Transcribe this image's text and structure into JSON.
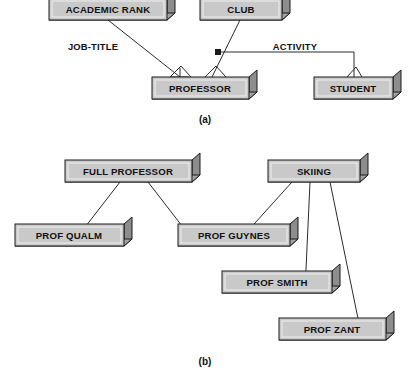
{
  "figure": {
    "background_color": "#ffffff",
    "box_fill_color": "#c9c9c9",
    "box_side_color": "#8d8d8d",
    "box_bottom_color": "#a2a2a2",
    "line_color": "#2b2b2b",
    "text_color": "#111111"
  },
  "panels": [
    {
      "id": "panel-a",
      "caption": "(a)",
      "caption_x": 205,
      "caption_y": 120,
      "nodes": [
        {
          "id": "academic-rank",
          "label": "ACADEMIC RANK",
          "x": 49,
          "y": -2,
          "w": 118,
          "h": 22
        },
        {
          "id": "club",
          "label": "CLUB",
          "x": 200,
          "y": -2,
          "w": 82,
          "h": 22
        },
        {
          "id": "professor",
          "label": "PROFESSOR",
          "x": 152,
          "y": 77,
          "w": 97,
          "h": 22
        },
        {
          "id": "student",
          "label": "STUDENT",
          "x": 314,
          "y": 77,
          "w": 79,
          "h": 22
        }
      ],
      "edges": [
        {
          "id": "job-title-edge",
          "label": "JOB-TITLE",
          "label_x": 93,
          "label_y": 48,
          "from": "academic-rank",
          "to": "professor",
          "marker": "crowfoot"
        },
        {
          "id": "club-professor-edge",
          "label": "",
          "from": "club",
          "to": "professor",
          "marker": "crowfoot"
        },
        {
          "id": "activity-edge",
          "label": "ACTIVITY",
          "label_x": 295,
          "label_y": 48,
          "from": "club",
          "to": "student",
          "marker": "crowfoot"
        }
      ],
      "junction": {
        "id": "activity-junction",
        "x": 218,
        "y": 52
      }
    },
    {
      "id": "panel-b",
      "caption": "(b)",
      "caption_x": 205,
      "caption_y": 362,
      "nodes": [
        {
          "id": "full-professor",
          "label": "FULL PROFESSOR",
          "x": 65,
          "y": 160,
          "w": 127,
          "h": 22
        },
        {
          "id": "skiing",
          "label": "SKIING",
          "x": 268,
          "y": 160,
          "w": 92,
          "h": 22
        },
        {
          "id": "prof-qualm",
          "label": "PROF QUALM",
          "x": 15,
          "y": 224,
          "w": 109,
          "h": 22
        },
        {
          "id": "prof-guynes",
          "label": "PROF GUYNES",
          "x": 178,
          "y": 224,
          "w": 112,
          "h": 22
        },
        {
          "id": "prof-smith",
          "label": "PROF SMITH",
          "x": 222,
          "y": 271,
          "w": 110,
          "h": 22
        },
        {
          "id": "prof-zant",
          "label": "PROF ZANT",
          "x": 279,
          "y": 318,
          "w": 107,
          "h": 22
        }
      ],
      "edges": [
        {
          "id": "fp-qualm-edge",
          "from": "full-professor",
          "to": "prof-qualm",
          "label": "",
          "marker": "none"
        },
        {
          "id": "fp-guynes-edge",
          "from": "full-professor",
          "to": "prof-guynes",
          "label": "",
          "marker": "none"
        },
        {
          "id": "ski-guynes-edge",
          "from": "skiing",
          "to": "prof-guynes",
          "label": "",
          "marker": "none"
        },
        {
          "id": "ski-smith-edge",
          "from": "skiing",
          "to": "prof-smith",
          "label": "",
          "marker": "none"
        },
        {
          "id": "ski-zant-edge",
          "from": "skiing",
          "to": "prof-zant",
          "label": "",
          "marker": "none"
        }
      ]
    }
  ]
}
